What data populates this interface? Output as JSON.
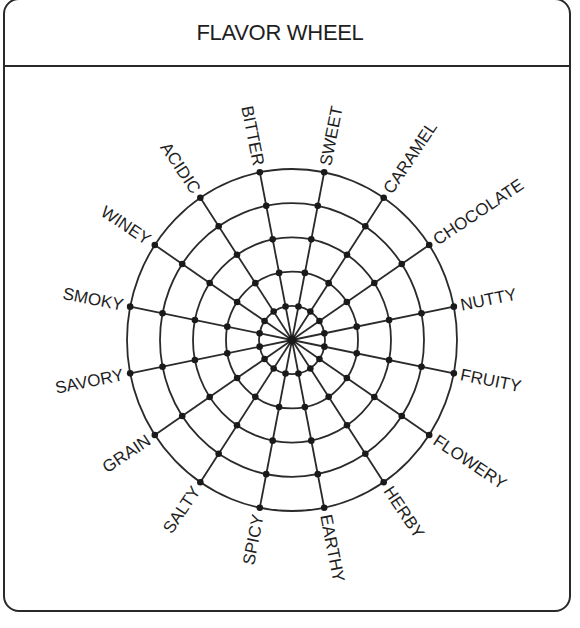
{
  "header": {
    "title": "FLAVOR WHEEL"
  },
  "wheel": {
    "center": [
      292,
      340
    ],
    "radius_x": 165,
    "radius_y": 171,
    "rings": 5,
    "start_angle_deg": -11.25,
    "stroke_color": "#2a2a2a",
    "dot_color": "#1a1a1a",
    "spokes": [
      {
        "label": "NUTTY"
      },
      {
        "label": "FRUITY"
      },
      {
        "label": "FLOWERY"
      },
      {
        "label": "HERBY"
      },
      {
        "label": "EARTHY"
      },
      {
        "label": "SPICY"
      },
      {
        "label": "SALTY"
      },
      {
        "label": "GRAIN"
      },
      {
        "label": "SAVORY"
      },
      {
        "label": "SMOKY"
      },
      {
        "label": "WINEY"
      },
      {
        "label": "ACIDIC"
      },
      {
        "label": "BITTER"
      },
      {
        "label": "SWEET"
      },
      {
        "label": "CARAMEL"
      },
      {
        "label": "CHOCOLATE"
      }
    ]
  }
}
